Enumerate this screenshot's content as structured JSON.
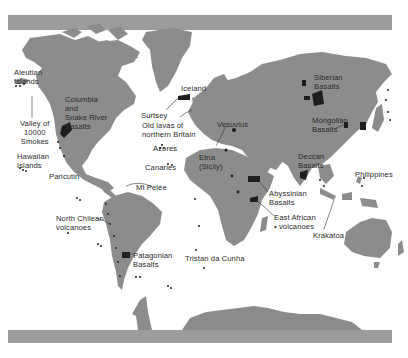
{
  "map": {
    "title": "",
    "colors": {
      "land": "#8c8c8c",
      "sea": "#ffffff",
      "frame_bar": "#9a9a9a",
      "volcanic": "#1e1e1e",
      "label_text": "#2a2a2a",
      "leader_line": "#333333"
    },
    "labels": [
      {
        "id": "aleutian-islands",
        "text": "Aleutian\nIslands",
        "x": 14,
        "y": 69
      },
      {
        "id": "valley-of-10000-smokes",
        "text": "Valley of\n10000\nSmokes",
        "x": 22,
        "y": 119
      },
      {
        "id": "columbia-snake-river-basalts",
        "text": "Columbia\nand\nSnake River\nBasalts",
        "x": 65,
        "y": 95
      },
      {
        "id": "hawaiian-islands",
        "text": "Hawaiian\nIslands",
        "x": 17,
        "y": 152
      },
      {
        "id": "paricutin",
        "text": "Paricutin",
        "x": 49,
        "y": 172
      },
      {
        "id": "iceland",
        "text": "Iceland",
        "x": 181,
        "y": 84
      },
      {
        "id": "surtsey",
        "text": "Surtsey",
        "x": 141,
        "y": 111
      },
      {
        "id": "old-lavas-northern-britain",
        "text": "Old lavas of\nnorthern Britain",
        "x": 142,
        "y": 121
      },
      {
        "id": "azores",
        "text": "Azores",
        "x": 153,
        "y": 144
      },
      {
        "id": "canaries",
        "text": "Canaries",
        "x": 145,
        "y": 163
      },
      {
        "id": "vesuvius",
        "text": "Vesuvius",
        "x": 217,
        "y": 120
      },
      {
        "id": "etna-sicily",
        "text": "Etna\n(Sicily)",
        "x": 199,
        "y": 153
      },
      {
        "id": "mt-pelee",
        "text": "Mt Pelée",
        "x": 136,
        "y": 183
      },
      {
        "id": "north-chilean-volcanoes",
        "text": "North Chilean\nvolcanoes",
        "x": 56,
        "y": 214
      },
      {
        "id": "patagonian-basalts",
        "text": "Patagonian\nBasalts",
        "x": 133,
        "y": 251
      },
      {
        "id": "tristan-da-cunha",
        "text": "Tristan da Cunha",
        "x": 185,
        "y": 254
      },
      {
        "id": "siberian-basalts",
        "text": "Siberian\nBasalts",
        "x": 314,
        "y": 73
      },
      {
        "id": "mongolian-basalts",
        "text": "Mongolian\nBasalts",
        "x": 312,
        "y": 116
      },
      {
        "id": "deccan-basalts",
        "text": "Deccan\nBasalts",
        "x": 298,
        "y": 152
      },
      {
        "id": "philippines",
        "text": "Philippines",
        "x": 355,
        "y": 170
      },
      {
        "id": "abyssinian-basalts",
        "text": "Abyssinian\nBasalts",
        "x": 269,
        "y": 189
      },
      {
        "id": "east-african-volcanoes",
        "text": "East African\n• volcanoes",
        "x": 274,
        "y": 213
      },
      {
        "id": "krakatoa",
        "text": "Krakatoa",
        "x": 313,
        "y": 231
      }
    ]
  }
}
